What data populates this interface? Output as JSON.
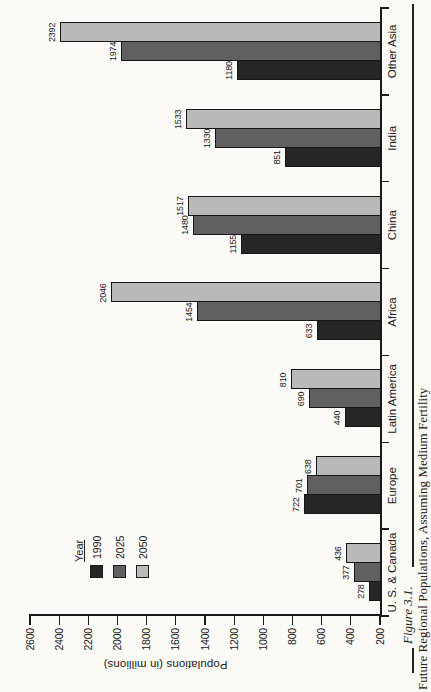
{
  "caption": {
    "figure_label": "Figure 3.1.",
    "title": "Future Regional Populations, Assuming Medium Fertility"
  },
  "chart_data": {
    "type": "bar",
    "title": "",
    "xlabel": "",
    "ylabel": "Populations (in millions)",
    "categories": [
      "U. S. & Canada",
      "Europe",
      "Latin America",
      "Africa",
      "China",
      "India",
      "Other Asia"
    ],
    "series": [
      {
        "name": "1990",
        "color": "#262626",
        "values": [
          278,
          722,
          440,
          633,
          1155,
          851,
          1180
        ]
      },
      {
        "name": "2025",
        "color": "#606060",
        "values": [
          377,
          701,
          690,
          1454,
          1480,
          1330,
          1974
        ]
      },
      {
        "name": "2050",
        "color": "#b9b9b9",
        "values": [
          436,
          638,
          810,
          2046,
          1517,
          1533,
          2392
        ]
      }
    ],
    "ylim": [
      200,
      2600
    ],
    "ytick_step": 200,
    "bar_value_labels": true,
    "legend_title": "Year",
    "legend_position": "top-left-inside",
    "grid": false,
    "page_rotation": "figure rotated 90 degrees counterclockwise on portrait page"
  },
  "colors": {
    "page_background": "#fbfaf6",
    "ink": "#202020"
  }
}
